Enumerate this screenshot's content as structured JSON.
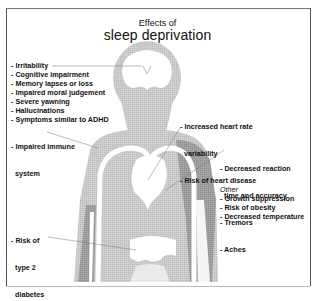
{
  "title": {
    "line1": "Effects of",
    "line2": "sleep deprivation"
  },
  "groups": {
    "brain": {
      "items": [
        "- Irritability",
        "- Cognitive impairment",
        "- Memory lapses or loss",
        "- Impaired moral judgement",
        "- Severe yawning",
        "- Hallucinations",
        "- Symptoms similar to ADHD"
      ]
    },
    "immune": {
      "items": [
        "- Impaired immune",
        "  system"
      ]
    },
    "heart": {
      "items": [
        "- Increased heart rate",
        "  variability",
        "- Risk of heart disease"
      ]
    },
    "muscles": {
      "items": [
        "- Decreased reaction",
        "  time and accuracy",
        "- Tremors",
        "- Aches"
      ]
    },
    "other": {
      "heading": "Other",
      "items": [
        "- Growth suppression",
        "- Risk of obesity",
        "- Decreased temperature"
      ]
    },
    "diabetes": {
      "items": [
        "- Risk of",
        "  type 2",
        "  diabetes"
      ]
    }
  },
  "colors": {
    "body_fill": "#c8c8c8",
    "dark_organ": "#8a8a8a",
    "white_organ": "#ffffff",
    "text": "#111111",
    "frame": "#555555"
  }
}
